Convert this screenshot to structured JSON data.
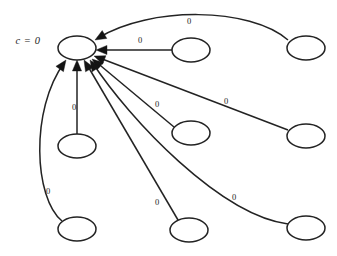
{
  "figure": {
    "type": "directed-graph",
    "background_color": "#ffffff",
    "stroke_color": "#232323",
    "arrow_color": "#141414",
    "text_color": "#1c1c1c",
    "width": 337,
    "height": 256
  },
  "annotations": [
    {
      "id": "center-label",
      "text": "c = 0",
      "x": 28,
      "y": 42
    }
  ],
  "nodes": [
    {
      "id": "center",
      "label": "",
      "cx": 77,
      "cy": 48,
      "rx": 19,
      "ry": 12
    },
    {
      "id": "top-right",
      "label": "",
      "cx": 306,
      "cy": 48,
      "rx": 19,
      "ry": 12
    },
    {
      "id": "right-upper",
      "label": "",
      "cx": 191,
      "cy": 50,
      "rx": 19,
      "ry": 12
    },
    {
      "id": "right-middle",
      "label": "",
      "cx": 306,
      "cy": 136,
      "rx": 19,
      "ry": 12
    },
    {
      "id": "center-mid",
      "label": "",
      "cx": 191,
      "cy": 133,
      "rx": 19,
      "ry": 12
    },
    {
      "id": "left-lower",
      "label": "",
      "cx": 77,
      "cy": 146,
      "rx": 19,
      "ry": 12
    },
    {
      "id": "bottom-left",
      "label": "",
      "cx": 77,
      "cy": 229,
      "rx": 19,
      "ry": 12
    },
    {
      "id": "bottom-mid",
      "label": "",
      "cx": 189,
      "cy": 230,
      "rx": 19,
      "ry": 12
    },
    {
      "id": "bottom-right",
      "label": "",
      "cx": 306,
      "cy": 228,
      "rx": 19,
      "ry": 12
    }
  ],
  "edges": [
    {
      "id": "edge-top-right",
      "from": "top-right",
      "to": "center",
      "weight": "0",
      "label_x": 189,
      "label_y": 22,
      "path": "M 288 40 C 250 7 150 6 98 38",
      "arrow_x": 95,
      "arrow_y": 40,
      "arrow_angle": 150
    },
    {
      "id": "edge-right-upper",
      "from": "right-upper",
      "to": "center",
      "weight": "0",
      "label_x": 140,
      "label_y": 41,
      "path": "M 172 50 L 99 50",
      "arrow_x": 96,
      "arrow_y": 50,
      "arrow_angle": 180
    },
    {
      "id": "edge-right-middle",
      "from": "right-middle",
      "to": "center",
      "weight": "0",
      "label_x": 226,
      "label_y": 102,
      "path": "M 288 130 L 97 57",
      "arrow_x": 94,
      "arrow_y": 56,
      "arrow_angle": 201
    },
    {
      "id": "edge-center-mid",
      "from": "center-mid",
      "to": "center",
      "weight": "0",
      "label_x": 157,
      "label_y": 105,
      "path": "M 174 127 L 95 61",
      "arrow_x": 92,
      "arrow_y": 59,
      "arrow_angle": 220
    },
    {
      "id": "edge-bottom-right",
      "from": "bottom-right",
      "to": "center",
      "weight": "0",
      "label_x": 234,
      "label_y": 198,
      "path": "M 288 224 C 220 215 130 120 92 62",
      "arrow_x": 90,
      "arrow_y": 60,
      "arrow_angle": 237
    },
    {
      "id": "edge-bottom-mid",
      "from": "bottom-mid",
      "to": "center",
      "weight": "0",
      "label_x": 157,
      "label_y": 203,
      "path": "M 178 220 L 86 63",
      "arrow_x": 84,
      "arrow_y": 60,
      "arrow_angle": 240
    },
    {
      "id": "edge-left-lower",
      "from": "left-lower",
      "to": "center",
      "weight": "0",
      "label_x": 74,
      "label_y": 108,
      "path": "M 77 134 L 77 63",
      "arrow_x": 77,
      "arrow_y": 60,
      "arrow_angle": 270
    },
    {
      "id": "edge-bottom-left",
      "from": "bottom-left",
      "to": "center",
      "weight": "0",
      "label_x": 48,
      "label_y": 192,
      "path": "M 62 221 C 34 198 30 110 64 63",
      "arrow_x": 66,
      "arrow_y": 60,
      "arrow_angle": 305
    }
  ]
}
